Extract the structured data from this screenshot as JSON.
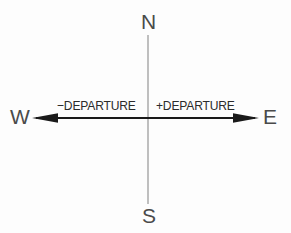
{
  "diagram": {
    "background_color": "#fdfdfd",
    "cardinal": {
      "north": "N",
      "south": "S",
      "west": "W",
      "east": "E"
    },
    "labels": {
      "negative_departure": "−DEPARTURE",
      "positive_departure": "+DEPARTURE"
    },
    "colors": {
      "cardinal_text": "#4a4a4a",
      "departure_text": "#2b2b2b",
      "horizontal_axis": "#1a1a1a",
      "vertical_axis": "#8c8c8c"
    },
    "geometry": {
      "origin_x": 148,
      "origin_y": 118,
      "vertical_axis_top": 35,
      "vertical_axis_bottom": 204,
      "horizontal_axis_left": 33,
      "horizontal_axis_right": 258
    }
  }
}
